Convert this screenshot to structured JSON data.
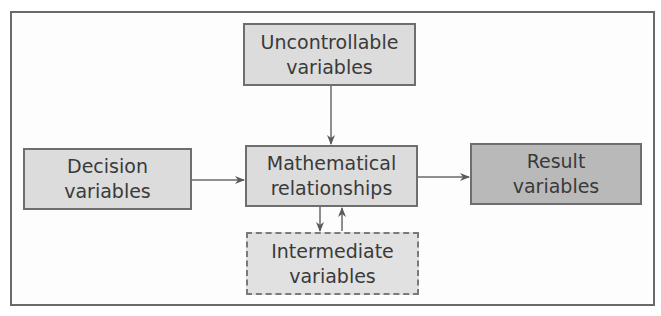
{
  "diagram": {
    "nodes": {
      "uncontrollable": {
        "line1": "Uncontrollable",
        "line2": "variables"
      },
      "decision": {
        "line1": "Decision",
        "line2": "variables"
      },
      "mathematical": {
        "line1": "Mathematical",
        "line2": "relationships"
      },
      "result": {
        "line1": "Result",
        "line2": "variables"
      },
      "intermediate": {
        "line1": "Intermediate",
        "line2": "variables"
      }
    },
    "edges": [
      {
        "from": "uncontrollable",
        "to": "mathematical"
      },
      {
        "from": "decision",
        "to": "mathematical"
      },
      {
        "from": "mathematical",
        "to": "result"
      },
      {
        "from": "mathematical",
        "to": "intermediate"
      },
      {
        "from": "intermediate",
        "to": "mathematical"
      }
    ],
    "colors": {
      "box_fill": "#dcdcdc",
      "result_fill": "#b9b9b9",
      "border": "#6e6e6e",
      "text": "#3a3a3a"
    }
  }
}
